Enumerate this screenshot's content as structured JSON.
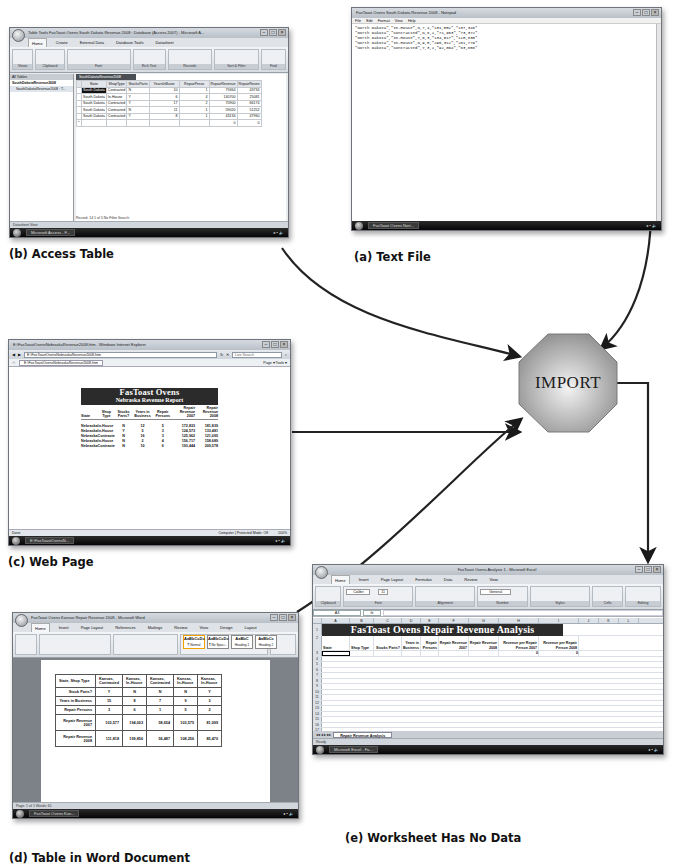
{
  "diagram": {
    "center_node": {
      "label": "IMPORT",
      "shape": "octagon",
      "fill": "#a7a7a7"
    },
    "captions": {
      "a": "(a) Text File",
      "b": "(b) Access Table",
      "c": "(c) Web Page",
      "d": "(d) Table in Word Document",
      "e": "(e) Worksheet Has No Data"
    }
  },
  "access": {
    "title": "Table Tools    FasToast Ovens South Dakota Revenue 2008 : Database (Access 2007) - Microsoft A...",
    "tabs": [
      "Home",
      "Create",
      "External Data",
      "Database Tools",
      "Datasheet"
    ],
    "ribbon_groups": [
      "Views",
      "Clipboard",
      "Font",
      "Rich Text",
      "Records",
      "Sort & Filter",
      "Find"
    ],
    "nav": {
      "header": "All Tables",
      "group": "SouthDakotaRevenue2008",
      "item": "SouthDakotaRevenue2008 : T..."
    },
    "doc_tab": "SouthDakotaRevenue2008",
    "columns": [
      "State",
      "ShopType",
      "StocksParts",
      "YearsInBusin",
      "RepairPerso",
      "RepairRevenue",
      "RepairReven"
    ],
    "rows": [
      [
        "South Dakota",
        "Contracted",
        "N",
        "10",
        "1",
        "79464",
        "43734"
      ],
      [
        "South Dakota",
        "In-House",
        "Y",
        "6",
        "4",
        "140700",
        "25081"
      ],
      [
        "South Dakota",
        "Contracted",
        "Y",
        "17",
        "2",
        "70900",
        "66174"
      ],
      [
        "South Dakota",
        "Contracted",
        "N",
        "11",
        "1",
        "59020",
        "51252"
      ],
      [
        "South Dakota",
        "Contracted",
        "Y",
        "8",
        "1",
        "43134",
        "47960"
      ],
      [
        "*",
        "",
        "",
        "",
        "",
        "0",
        "0"
      ]
    ],
    "record_nav": "Record: 14  1 of 5   No Filter   Search",
    "status": "Datasheet View",
    "taskbar_item": "Microsoft Access - F..."
  },
  "notepad": {
    "title": "FasToast Ovens South Dakota Revenue 2008 - Notepad",
    "menu": [
      "File",
      "Edit",
      "Format",
      "View",
      "Help"
    ],
    "lines": [
      "\"North Dakota\",\"In-House\",N,7,4,\"131,551\",\"137,348\"",
      "\"North Dakota\",\"Contracted\",N,8,2,\"71,963\",\"73,372\"",
      "\"North Dakota\",\"In-House\",Y,6,3,\"134,017\",\"120,835\"",
      "\"North Dakota\",\"In-House\",N,9,5,\"296,312\",\"281,779\"",
      "\"North Dakota\",\"Contracted\",Y,3,2,\"92,064\",\"83,858\""
    ],
    "taskbar_item": "FasToast Ovens Nort..."
  },
  "ie": {
    "title": "E:\\FasToastOvensNebraskaRevenue2008.htm - Windows Internet Explorer",
    "url": "E:\\FasToastOvensNebraskaRevenue2008.htm",
    "search_placeholder": "Live Search",
    "tab": "E:\\FasToastOvensNebraskaRevenue2008.htm",
    "toolbar": "Page ▾  Tools ▾",
    "report": {
      "title": "FasToast Ovens",
      "subtitle": "Nebraska Revenue Report",
      "columns": [
        "State",
        "Shop Type",
        "Stocks Parts?",
        "Years in Business",
        "Repair Persons",
        "Repair Revenue 2007",
        "Repair Revenue 2008"
      ],
      "rows": [
        [
          "Nebraska",
          "In-House",
          "N",
          "12",
          "5",
          "172,833",
          "181,839"
        ],
        [
          "Nebraska",
          "In-House",
          "Y",
          "5",
          "3",
          "124,573",
          "133,481"
        ],
        [
          "Nebraska",
          "Contracte",
          "N",
          "16",
          "3",
          "125,962",
          "121,095"
        ],
        [
          "Nebraska",
          "In-House",
          "N",
          "2",
          "4",
          "156,717",
          "158,689"
        ],
        [
          "Nebraska",
          "Contracte",
          "N",
          "10",
          "6",
          "193,444",
          "209,578"
        ]
      ]
    },
    "status_left": "Done",
    "status_zone": "Computer | Protected Mode: Off",
    "zoom": "100%",
    "taskbar_item": "E:\\FasToastOvensN..."
  },
  "word": {
    "title": "FasToast Ovens Kansas Repair Revenue 2008 - Microsoft Word",
    "context_tab": "Table Tools",
    "tabs": [
      "Home",
      "Insert",
      "Page Layout",
      "References",
      "Mailings",
      "Review",
      "View",
      "Design",
      "Layout"
    ],
    "styles": [
      {
        "sample": "AaBbCcDc",
        "name": "¶ Normal"
      },
      {
        "sample": "AaBbCcDc",
        "name": "¶ No Spaci..."
      },
      {
        "sample": "AaBbC",
        "name": "Heading 1"
      },
      {
        "sample": "AaBbCc",
        "name": "Heading 2"
      }
    ],
    "table": {
      "header": [
        "State, Shop Type",
        "Kansas, Contracted",
        "Kansas, In-House",
        "Kansas, Contracted",
        "Kansas, In-House",
        "Kansas, In-House"
      ],
      "rows": [
        [
          "Stock Parts?",
          "Y",
          "N",
          "N",
          "N",
          "Y"
        ],
        [
          "Years in Business",
          "15",
          "8",
          "7",
          "9",
          "3"
        ],
        [
          "Repair Persons",
          "3",
          "6",
          "1",
          "5",
          "2"
        ],
        [
          "Repair Revenue 2007",
          "103,577",
          "194,003",
          "58,654",
          "103,575",
          "81,099"
        ],
        [
          "Repair Revenue 2008",
          "111,818",
          "199,856",
          "56,487",
          "108,256",
          "85,470"
        ]
      ]
    },
    "status": "Page: 1 of 1   Words: 61",
    "taskbar_item": "FasToast Ovens Kan..."
  },
  "excel": {
    "title": "FasToast Ovens Analysis 1 - Microsoft Excel",
    "tabs": [
      "Home",
      "Insert",
      "Page Layout",
      "Formulas",
      "Data",
      "Review",
      "View"
    ],
    "font_name": "Calibri",
    "font_size": "11",
    "number_format": "General",
    "ribbon_groups": [
      "Clipboard",
      "Font",
      "Alignment",
      "Number",
      "Styles",
      "Cells",
      "Editing"
    ],
    "name_box": "A3",
    "fx": "fx",
    "column_letters": [
      "A",
      "B",
      "C",
      "D",
      "E",
      "F",
      "G",
      "H",
      "I",
      "J",
      "K",
      "L"
    ],
    "sheet_title": "FasToast Ovens Repair Revenue Analysis",
    "headers": [
      "State",
      "Shop Type",
      "Stocks Parts?",
      "Years in Business",
      "Repair Persons",
      "Repair Revenue 2007",
      "Repair Revenue 2008",
      "Revenue per Repair Person 2007",
      "Revenue per Repair Person 2008"
    ],
    "row3_values": {
      "H": "0",
      "I": "0"
    },
    "row_numbers": [
      "1",
      "2",
      "3",
      "4",
      "5",
      "6",
      "7",
      "8",
      "9",
      "10",
      "11",
      "12",
      "13",
      "14",
      "15",
      "16",
      "17",
      "18",
      "19",
      "20",
      "21",
      "22",
      "23",
      "24"
    ],
    "sheet_tab": "Repair Revenue Analysis",
    "status": "Ready",
    "taskbar_item": "Microsoft Excel - Fa..."
  }
}
